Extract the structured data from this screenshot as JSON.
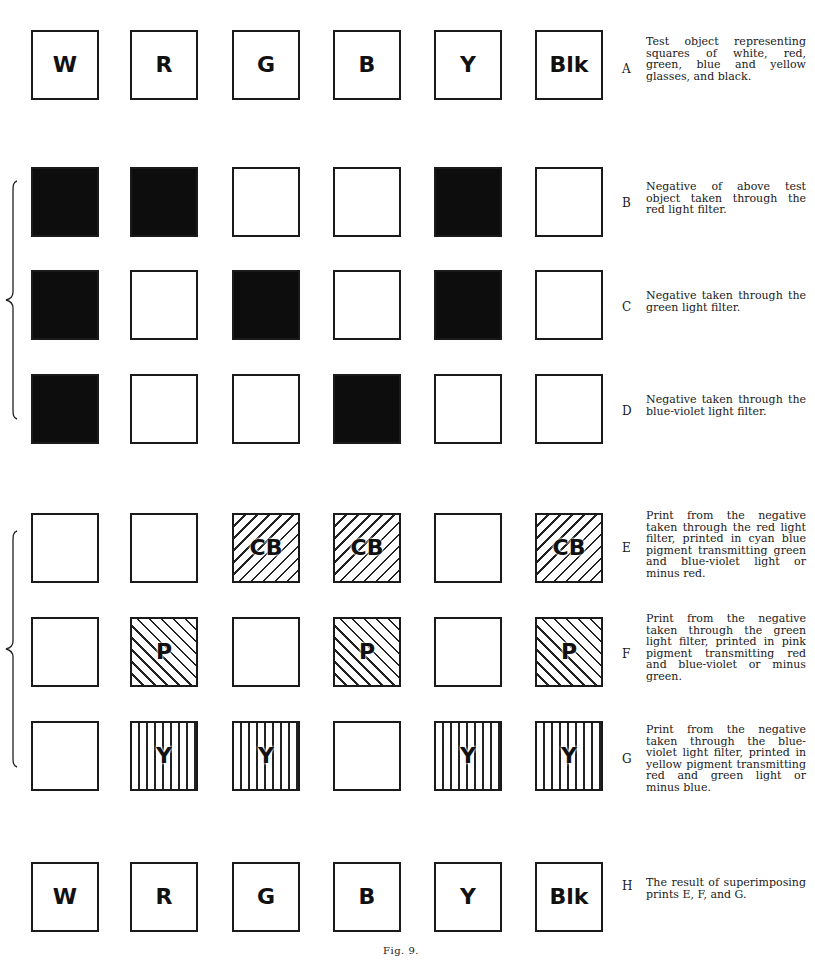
{
  "figure": {
    "caption": "Fig. 9.",
    "columns": [
      "W",
      "R",
      "G",
      "B",
      "Y",
      "Blk"
    ],
    "rows": [
      {
        "id": "A",
        "top": 30,
        "description": "Test object representing squares of white, red, green, blue and yellow glasses, and black.",
        "cells": [
          {
            "fill": "white",
            "label": "W"
          },
          {
            "fill": "white",
            "label": "R"
          },
          {
            "fill": "white",
            "label": "G"
          },
          {
            "fill": "white",
            "label": "B"
          },
          {
            "fill": "white",
            "label": "Y"
          },
          {
            "fill": "white",
            "label": "Blk"
          }
        ]
      },
      {
        "id": "B",
        "top": 167,
        "description": "Negative of above test object taken through the red light filter.",
        "cells": [
          {
            "fill": "black",
            "label": ""
          },
          {
            "fill": "black",
            "label": ""
          },
          {
            "fill": "white",
            "label": ""
          },
          {
            "fill": "white",
            "label": ""
          },
          {
            "fill": "black",
            "label": ""
          },
          {
            "fill": "white",
            "label": ""
          }
        ]
      },
      {
        "id": "C",
        "top": 270,
        "description": "Negative taken through the green light filter.",
        "cells": [
          {
            "fill": "black",
            "label": ""
          },
          {
            "fill": "white",
            "label": ""
          },
          {
            "fill": "black",
            "label": ""
          },
          {
            "fill": "white",
            "label": ""
          },
          {
            "fill": "black",
            "label": ""
          },
          {
            "fill": "white",
            "label": ""
          }
        ]
      },
      {
        "id": "D",
        "top": 374,
        "description": "Negative taken through the blue-violet light filter.",
        "cells": [
          {
            "fill": "black",
            "label": ""
          },
          {
            "fill": "white",
            "label": ""
          },
          {
            "fill": "white",
            "label": ""
          },
          {
            "fill": "black",
            "label": ""
          },
          {
            "fill": "white",
            "label": ""
          },
          {
            "fill": "white",
            "label": ""
          }
        ]
      },
      {
        "id": "E",
        "top": 513,
        "description": "Print from the negative taken through the red light filter, printed in cyan blue pigment transmitting green and blue-violet light or minus red.",
        "cells": [
          {
            "fill": "white",
            "label": ""
          },
          {
            "fill": "white",
            "label": ""
          },
          {
            "fill": "hatch-fwd",
            "label": "CB"
          },
          {
            "fill": "hatch-fwd",
            "label": "CB"
          },
          {
            "fill": "white",
            "label": ""
          },
          {
            "fill": "hatch-fwd",
            "label": "CB"
          }
        ]
      },
      {
        "id": "F",
        "top": 617,
        "description": "Print from the negative taken through the green light filter, printed in pink pigment transmitting red and blue-violet or minus green.",
        "cells": [
          {
            "fill": "white",
            "label": ""
          },
          {
            "fill": "hatch-back",
            "label": "P"
          },
          {
            "fill": "white",
            "label": ""
          },
          {
            "fill": "hatch-back",
            "label": "P"
          },
          {
            "fill": "white",
            "label": ""
          },
          {
            "fill": "hatch-back",
            "label": "P"
          }
        ]
      },
      {
        "id": "G",
        "top": 721,
        "description": "Print from the negative taken through the blue-violet light filter, printed in yellow pigment transmitting red and green light or minus blue.",
        "cells": [
          {
            "fill": "white",
            "label": ""
          },
          {
            "fill": "hatch-vert",
            "label": "Y"
          },
          {
            "fill": "hatch-vert",
            "label": "Y"
          },
          {
            "fill": "white",
            "label": ""
          },
          {
            "fill": "hatch-vert",
            "label": "Y"
          },
          {
            "fill": "hatch-vert",
            "label": "Y"
          }
        ]
      },
      {
        "id": "H",
        "top": 862,
        "description": "The result of superimposing prints E, F, and G.",
        "cells": [
          {
            "fill": "white",
            "label": "W"
          },
          {
            "fill": "white",
            "label": "R"
          },
          {
            "fill": "white",
            "label": "G"
          },
          {
            "fill": "white",
            "label": "B"
          },
          {
            "fill": "white",
            "label": "Y"
          },
          {
            "fill": "white",
            "label": "Blk"
          }
        ]
      }
    ],
    "braces": [
      {
        "groups_rows": [
          "B",
          "C",
          "D"
        ],
        "top": 180,
        "height": 240
      },
      {
        "groups_rows": [
          "E",
          "F",
          "G"
        ],
        "top": 530,
        "height": 238
      }
    ]
  }
}
